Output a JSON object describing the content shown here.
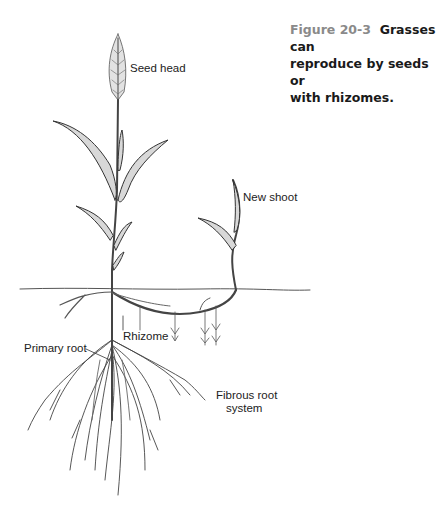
{
  "caption": {
    "figure_number": "Figure 20-3",
    "text": "Grasses can reproduce by seeds or with rhizomes.",
    "line1": "Grasses can",
    "line2": "reproduce by seeds or",
    "line3": "with rhizomes.",
    "figure_number_color": "#8a8a8a"
  },
  "labels": {
    "seed_head": "Seed head",
    "new_shoot": "New shoot",
    "rhizome": "Rhizome",
    "primary_root": "Primary root",
    "fibrous_root_line1": "Fibrous root",
    "fibrous_root_line2": "system"
  },
  "colors": {
    "line": "#333333",
    "leaf_fill": "#d8d8d8",
    "background": "#ffffff"
  }
}
